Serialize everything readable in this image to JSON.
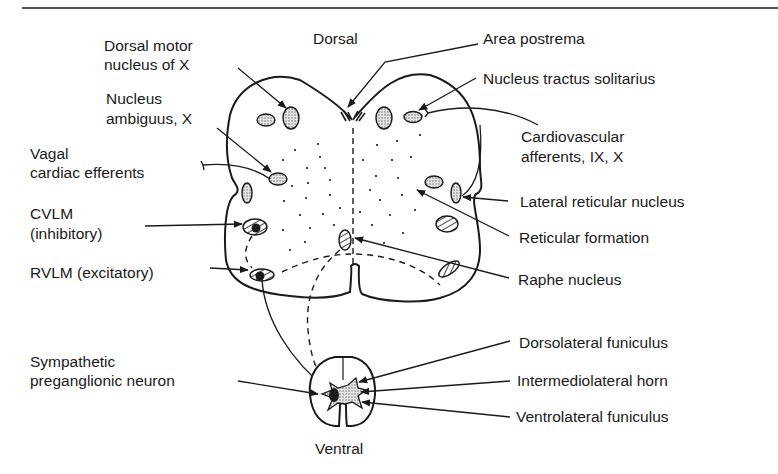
{
  "figure": {
    "orientation": {
      "top": "Dorsal",
      "bottom": "Ventral"
    },
    "labels_left": {
      "dorsal_motor_nucleus": [
        "Dorsal motor",
        "nucleus of X"
      ],
      "nucleus_ambiguus": [
        "Nucleus",
        "ambiguus, X"
      ],
      "vagal_cardiac": [
        "Vagal",
        "cardiac efferents"
      ],
      "cvlm": [
        "CVLM",
        "(inhibitory)"
      ],
      "rvlm": "RVLM (excitatory)",
      "sympathetic": [
        "Sympathetic",
        "preganglionic neuron"
      ]
    },
    "labels_right": {
      "area_postrema": "Area postrema",
      "nts": "Nucleus tractus solitarius",
      "cardiovascular_afferents": [
        "Cardiovascular",
        "afferents, IX, X"
      ],
      "lateral_reticular": "Lateral reticular nucleus",
      "reticular_formation": "Reticular formation",
      "raphe": "Raphe nucleus",
      "dorsolateral_funiculus": "Dorsolateral funiculus",
      "intermediolateral_horn": "Intermediolateral horn",
      "ventrolateral_funiculus": "Ventrolateral funiculus"
    },
    "colors": {
      "ink": "#1a1a1a",
      "stipple": "#b8b8b8",
      "rule": "#555555"
    }
  }
}
